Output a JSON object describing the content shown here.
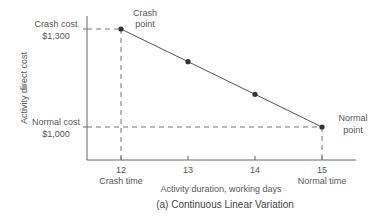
{
  "chart_data": {
    "type": "line",
    "title": "(a)  Continuous Linear Variation",
    "xlabel": "Activity duration, working days",
    "ylabel": "Activity direct cost",
    "x": [
      12,
      13,
      14,
      15
    ],
    "series": [
      {
        "name": "Direct cost",
        "values": [
          1300,
          1200,
          1100,
          1000
        ]
      }
    ],
    "xlim": [
      11,
      15.5
    ],
    "ylim": [
      900,
      1300
    ],
    "xticks": [
      {
        "value": 12,
        "label": "12",
        "sublabel": "Crash time"
      },
      {
        "value": 13,
        "label": "13",
        "sublabel": ""
      },
      {
        "value": 14,
        "label": "14",
        "sublabel": ""
      },
      {
        "value": 15,
        "label": "15",
        "sublabel": "Normal time"
      }
    ],
    "yannotations": [
      {
        "value": 1300,
        "line1": "Crash cost",
        "line2": "$1,300"
      },
      {
        "value": 1000,
        "line1": "Normal cost",
        "line2": "$1,000"
      }
    ],
    "point_annotations": [
      {
        "x": 12,
        "y": 1300,
        "line1": "Crash",
        "line2": "point",
        "position": "above-right"
      },
      {
        "x": 15,
        "y": 1000,
        "line1": "Normal",
        "line2": "point",
        "position": "right"
      }
    ],
    "grid": false,
    "legend": "none"
  }
}
